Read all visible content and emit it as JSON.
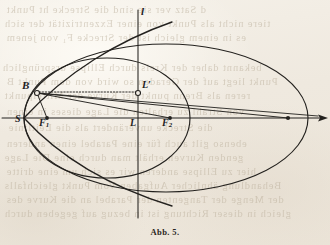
{
  "page": {
    "width": 330,
    "height": 245,
    "background_color": "#f1ece3",
    "ink_color": "#23211e",
    "ghost_text_color": "#b9ad99"
  },
  "caption": {
    "text": "Abb. 5.",
    "x": 0,
    "y": 227
  },
  "ghost_text": [
    {
      "text": "d Satz ver sie  sind  die   Strecke  ht  Punkt",
      "x": 6,
      "y": 4
    },
    {
      "text": "tiere nicht  als  Punkt  von  einer  Exzentrizität  der sich",
      "x": 4,
      "y": 18
    },
    {
      "text": "es  in  einem  gleich  ist  der  Strecke  F₁  von  jenem",
      "x": 6,
      "y": 32
    },
    {
      "text": "bekannt   daher   der   Kreis   durch   Ellipse   ursprünglich",
      "x": 2,
      "y": 62
    },
    {
      "text": "Punkt  liegt  auf  der  Geraden  so  wird  von  dem  Punkt  B",
      "x": 6,
      "y": 76
    },
    {
      "text": "reren  als  Brenn  punkt  der  Kurve   der   Mittelpunkt",
      "x": 4,
      "y": 90
    },
    {
      "text": "von  Strahl   zu  erhalten   die   Lage  dieses  in  einen",
      "x": 6,
      "y": 106
    },
    {
      "text": "die  Strecke  unverändert  als  die  Leitlinie",
      "x": 8,
      "y": 122
    },
    {
      "text": "ebenso  gilt  auch  für  eine  Parabel  einen  anderen",
      "x": 6,
      "y": 138
    },
    {
      "text": "genden  Kurven  erhält  man   durch   eine   Die  Lage",
      "x": 4,
      "y": 152
    },
    {
      "text": "hier  zu  Ellipse  anderen   wir   es   sich   um  eine  dritte",
      "x": 6,
      "y": 166
    },
    {
      "text": "Behandlung   ähnlicher   Aufgaben   Vom   Punkt   gleichfalls",
      "x": 4,
      "y": 180
    },
    {
      "text": "der  Menge  der  Tangenten  der  Parabel  an  die  Kurve   des",
      "x": 6,
      "y": 194
    },
    {
      "text": "gleich  in  dieser  Richtung  ist  in  bezug  auf  gegeben  durch",
      "x": 4,
      "y": 208
    }
  ],
  "chart_data": {
    "type": "diagram",
    "title": "Abb. 5.",
    "axes": {
      "horizontal_axis": {
        "name": "principal-axis",
        "y": 118,
        "x_start": 2,
        "x_end": 328,
        "has_arrow_right": true
      },
      "vertical_line": {
        "name": "directrix-l",
        "label": "l",
        "x": 138,
        "y_start": 10,
        "y_end": 218
      }
    },
    "points": [
      {
        "label": "S",
        "x": 25,
        "y": 118,
        "marker": "none",
        "label_x": 15,
        "label_y": 120
      },
      {
        "label": "F1",
        "x": 47,
        "y": 118,
        "marker": "filled-dot",
        "label_x": 40,
        "label_y": 124
      },
      {
        "label": "B",
        "x": 37,
        "y": 93,
        "marker": "open-circle",
        "label_x": 22,
        "label_y": 86
      },
      {
        "label": "L",
        "x": 138,
        "y": 118,
        "marker": "none",
        "label_x": 131,
        "label_y": 124
      },
      {
        "label": "L'",
        "x": 138,
        "y": 93,
        "marker": "open-circle",
        "label_x": 143,
        "label_y": 86
      },
      {
        "label": "F2",
        "x": 170,
        "y": 118,
        "marker": "filled-dot",
        "label_x": 163,
        "label_y": 124
      },
      {
        "label": "",
        "x": 288,
        "y": 118,
        "marker": "filled-dot",
        "label_x": 0,
        "label_y": 0
      }
    ],
    "curves": [
      {
        "name": "small-ellipse",
        "type": "ellipse",
        "cx": 107,
        "cy": 118,
        "rx": 83,
        "ry": 60
      },
      {
        "name": "large-ellipse",
        "type": "ellipse",
        "cx": 166,
        "cy": 118,
        "rx": 142,
        "ry": 74
      },
      {
        "name": "parabola",
        "type": "parabola",
        "vertex_x": 24,
        "vertex_y": 118,
        "opens": "right",
        "x_end": 170
      }
    ],
    "construction_lines": [
      {
        "name": "B-to-L-prime",
        "from": "B",
        "to": "L'",
        "style": "dotted"
      },
      {
        "name": "B-to-F1",
        "from": "B",
        "to": "F1",
        "style": "solid"
      },
      {
        "name": "B-to-F2",
        "from": "B",
        "to": "F2",
        "style": "solid"
      },
      {
        "name": "B-to-right-dot",
        "from": "B",
        "to": "right-dot",
        "style": "solid"
      },
      {
        "name": "B-to-axis-right",
        "from": "B",
        "to": "axis-right",
        "style": "solid"
      }
    ]
  },
  "labels": {
    "S": "S",
    "F1_base": "F",
    "F1_sub": "1",
    "B": "B",
    "L": "L",
    "L_prime": "L′",
    "F2_base": "F",
    "F2_sub": "2",
    "directrix": "l"
  }
}
